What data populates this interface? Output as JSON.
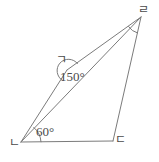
{
  "figure": {
    "type": "geometry-diagram",
    "stroke_color": "#7b7b7b",
    "text_color": "#4a4a4a",
    "background_color": "#ffffff",
    "width": 159,
    "height": 162,
    "vertices": [
      {
        "id": "g",
        "label": "ㄱ",
        "x": 67,
        "y": 70
      },
      {
        "id": "n",
        "label": "ㄴ",
        "x": 21,
        "y": 142
      },
      {
        "id": "d",
        "label": "ㄷ",
        "x": 113,
        "y": 141
      },
      {
        "id": "r",
        "label": "ㄹ",
        "x": 141,
        "y": 17
      }
    ],
    "segments": [
      {
        "name": "segment-n-g",
        "from": "n",
        "to": "g"
      },
      {
        "name": "segment-g-r",
        "from": "g",
        "to": "r"
      },
      {
        "name": "segment-n-r",
        "from": "n",
        "to": "r",
        "role": "diagonal"
      },
      {
        "name": "segment-n-d",
        "from": "n",
        "to": "d"
      },
      {
        "name": "segment-d-r",
        "from": "d",
        "to": "r"
      }
    ],
    "angles": [
      {
        "name": "angle-at-g",
        "vertex": "g",
        "value": "150°",
        "marked": true
      },
      {
        "name": "angle-at-n",
        "vertex": "n",
        "value": "60°",
        "marked": true
      },
      {
        "name": "angle-at-r",
        "vertex": "r",
        "value": "",
        "marked": true
      }
    ]
  }
}
